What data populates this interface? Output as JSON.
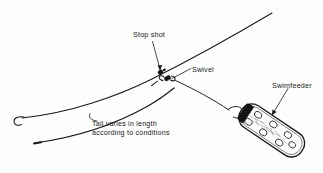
{
  "diagram": {
    "background_color": "#fefefe",
    "ink_color": "#1a1a1a",
    "labels": {
      "stop_shot": "Stop shot",
      "swivel": "Swivel",
      "swimfeeder": "Swimfeeder",
      "tail_line_1": "Tail varies in length",
      "tail_line_2": "according to conditions"
    },
    "parts": [
      {
        "name": "main-line",
        "label": "Main line"
      },
      {
        "name": "tail-line",
        "label": "Tail"
      },
      {
        "name": "hook",
        "label": "Hook"
      },
      {
        "name": "stop-shot",
        "label": "Stop shot"
      },
      {
        "name": "swivel",
        "label": "Swivel"
      },
      {
        "name": "link-line",
        "label": "Link"
      },
      {
        "name": "swimfeeder-body",
        "label": "Swimfeeder"
      },
      {
        "name": "swimfeeder-lead",
        "label": "Lead strip"
      }
    ]
  }
}
